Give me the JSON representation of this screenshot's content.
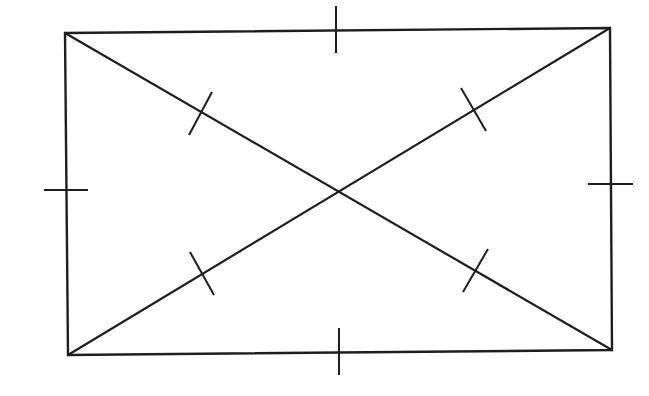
{
  "diagram": {
    "stroke_color": "#1e1e1e",
    "background": "#ffffff",
    "rectangle": {
      "top_left": [
        65,
        33
      ],
      "top_right": [
        610,
        28
      ],
      "bottom_right": [
        612,
        350
      ],
      "bottom_left": [
        68,
        355
      ]
    },
    "diagonal_intersection": [
      338,
      192
    ],
    "side_ticks": [
      {
        "side": "top",
        "x1": 336,
        "y1": 6,
        "x2": 336,
        "y2": 53
      },
      {
        "side": "bottom",
        "x1": 339,
        "y1": 328,
        "x2": 339,
        "y2": 375
      },
      {
        "side": "left",
        "x1": 44,
        "y1": 190,
        "x2": 88,
        "y2": 190
      },
      {
        "side": "right",
        "x1": 588,
        "y1": 184,
        "x2": 633,
        "y2": 184
      }
    ],
    "diagonal_ticks": [
      {
        "segment": "top-left-half",
        "x1": 212,
        "y1": 92,
        "x2": 189,
        "y2": 135
      },
      {
        "segment": "top-right-half",
        "x1": 461,
        "y1": 88,
        "x2": 486,
        "y2": 131
      },
      {
        "segment": "bottom-left-half",
        "x1": 190,
        "y1": 252,
        "x2": 214,
        "y2": 295
      },
      {
        "segment": "bottom-right-half",
        "x1": 488,
        "y1": 249,
        "x2": 463,
        "y2": 292
      }
    ]
  }
}
